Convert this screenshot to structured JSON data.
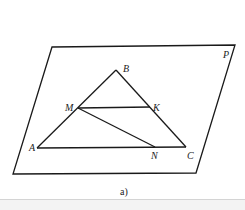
{
  "figure": {
    "caption": "a)",
    "plane": {
      "label": "P",
      "vertices": [
        [
          52,
          47
        ],
        [
          235,
          45
        ],
        [
          196,
          173
        ],
        [
          13,
          174
        ]
      ]
    },
    "points": {
      "A": {
        "label": "A",
        "x": 37,
        "y": 148
      },
      "B": {
        "label": "B",
        "x": 116,
        "y": 70
      },
      "C": {
        "label": "C",
        "x": 186,
        "y": 147
      },
      "M": {
        "label": "M",
        "x": 78,
        "y": 108
      },
      "K": {
        "label": "K",
        "x": 150,
        "y": 107
      },
      "N": {
        "label": "N",
        "x": 155,
        "y": 147
      }
    },
    "segments": [
      "AB",
      "BC",
      "AC",
      "MK",
      "MN"
    ],
    "colors": {
      "stroke": "#1a1a1a",
      "background": "#ffffff"
    }
  }
}
